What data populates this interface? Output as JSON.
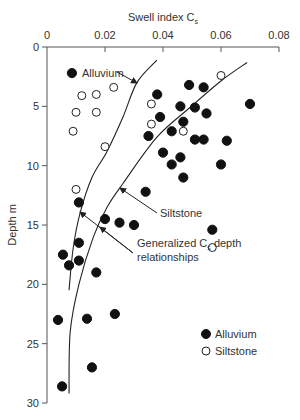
{
  "chart_data": {
    "type": "scatter",
    "title": "",
    "xlabel": "Swell index C",
    "xlabel_subscript": "s",
    "ylabel": "Depth m",
    "xlim": [
      0,
      0.08
    ],
    "ylim": [
      30,
      0
    ],
    "x_axis_position": "top",
    "y_axis_inverted": true,
    "grid": false,
    "x_ticks": [
      0,
      0.02,
      0.04,
      0.06,
      0.08
    ],
    "x_tick_labels": [
      "0",
      "0.02",
      "0.04",
      "0.06",
      "0.08"
    ],
    "y_ticks": [
      0,
      5,
      10,
      15,
      20,
      25,
      30
    ],
    "y_tick_labels": [
      "0",
      "5",
      "10",
      "15",
      "20",
      "25",
      "30"
    ],
    "legend": {
      "position": "lower right",
      "entries": [
        {
          "label": "Alluvium",
          "marker": "filled-circle"
        },
        {
          "label": "Siltstone",
          "marker": "open-circle"
        }
      ]
    },
    "series": [
      {
        "name": "Alluvium",
        "marker": "filled-circle",
        "points": [
          [
            0.0086,
            2.2
          ],
          [
            0.049,
            3.2
          ],
          [
            0.054,
            3.4
          ],
          [
            0.038,
            4.0
          ],
          [
            0.07,
            4.8
          ],
          [
            0.046,
            5.0
          ],
          [
            0.051,
            5.1
          ],
          [
            0.055,
            5.6
          ],
          [
            0.039,
            5.9
          ],
          [
            0.047,
            6.3
          ],
          [
            0.043,
            7.1
          ],
          [
            0.035,
            7.5
          ],
          [
            0.051,
            7.8
          ],
          [
            0.054,
            7.8
          ],
          [
            0.062,
            7.9
          ],
          [
            0.04,
            8.9
          ],
          [
            0.046,
            9.3
          ],
          [
            0.043,
            9.9
          ],
          [
            0.06,
            9.9
          ],
          [
            0.047,
            11.0
          ],
          [
            0.034,
            12.2
          ],
          [
            0.011,
            13.1
          ],
          [
            0.02,
            14.5
          ],
          [
            0.025,
            14.8
          ],
          [
            0.03,
            15.0
          ],
          [
            0.057,
            15.4
          ],
          [
            0.011,
            16.5
          ],
          [
            0.0055,
            17.5
          ],
          [
            0.011,
            18.0
          ],
          [
            0.0076,
            18.4
          ],
          [
            0.017,
            19.0
          ],
          [
            0.0234,
            22.5
          ],
          [
            0.0138,
            22.9
          ],
          [
            0.0038,
            23.0
          ],
          [
            0.0155,
            27.0
          ],
          [
            0.0052,
            28.6
          ]
        ]
      },
      {
        "name": "Siltstone",
        "marker": "open-circle",
        "points": [
          [
            0.06,
            2.4
          ],
          [
            0.023,
            3.4
          ],
          [
            0.017,
            4.0
          ],
          [
            0.012,
            4.1
          ],
          [
            0.036,
            4.8
          ],
          [
            0.01,
            5.5
          ],
          [
            0.017,
            5.5
          ],
          [
            0.036,
            6.5
          ],
          [
            0.009,
            7.1
          ],
          [
            0.047,
            7.1
          ],
          [
            0.02,
            8.4
          ],
          [
            0.01,
            12.0
          ],
          [
            0.057,
            16.9
          ]
        ]
      }
    ],
    "curves": [
      {
        "name": "Alluvium",
        "label": "Alluvium",
        "points": [
          [
            0.0379,
            1.1
          ],
          [
            0.031,
            3.0
          ],
          [
            0.0262,
            5.9
          ],
          [
            0.0207,
            8.8
          ],
          [
            0.0155,
            11.0
          ],
          [
            0.0114,
            14.0
          ],
          [
            0.009,
            17.0
          ],
          [
            0.0076,
            20.5
          ]
        ]
      },
      {
        "name": "Siltstone",
        "label": "Siltstone",
        "points": [
          [
            0.069,
            1.3
          ],
          [
            0.0603,
            2.8
          ],
          [
            0.0493,
            5.1
          ],
          [
            0.0379,
            7.6
          ],
          [
            0.0262,
            11.5
          ],
          [
            0.0207,
            13.5
          ],
          [
            0.016,
            16.0
          ],
          [
            0.011,
            20.0
          ],
          [
            0.008,
            24.0
          ],
          [
            0.0076,
            29.2
          ]
        ]
      }
    ],
    "annotations": [
      {
        "text": "Alluvium",
        "text_pos_px": [
          82,
          77
        ],
        "arrows_px": [
          [
            [
              117,
              72
            ],
            [
              137,
              83
            ]
          ]
        ]
      },
      {
        "text": "Siltstone",
        "text_pos_px": [
          160,
          217
        ],
        "arrows_px": [
          [
            [
              157,
              213
            ],
            [
              120,
              188
            ]
          ]
        ]
      },
      {
        "text_line1": "Generalized C",
        "subscript": "s",
        "text_line1_tail": " depth",
        "text_line2": "relationships",
        "text_pos_px": [
          137,
          243
        ],
        "arrows_px": [
          [
            [
              133,
              253
            ],
            [
              80,
              212
            ]
          ],
          [
            [
              133,
              253
            ],
            [
              100,
              227
            ]
          ]
        ]
      }
    ]
  },
  "labels": {
    "x_title": "Swell index C",
    "x_title_sub": "s",
    "y_title": "Depth m",
    "annot_alluvium": "Alluvium",
    "annot_siltstone": "Siltstone",
    "annot_general_1": "Generalized C",
    "annot_general_sub": "s",
    "annot_general_1_tail": " depth",
    "annot_general_2": "relationships",
    "legend_alluvium": "Alluvium",
    "legend_siltstone": "Siltstone"
  }
}
